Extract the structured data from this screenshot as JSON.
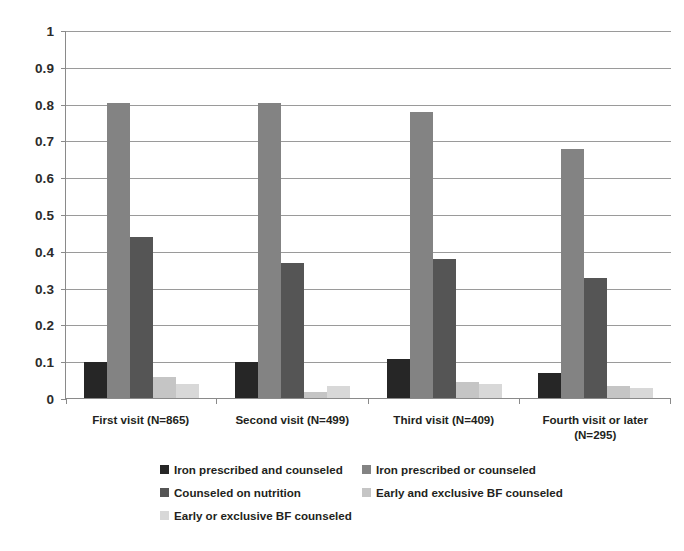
{
  "chart_data": {
    "type": "bar",
    "title": "",
    "subtitle": "",
    "xlabel": "",
    "ylabel": "",
    "ylim": [
      0,
      1
    ],
    "ytick_labels": [
      "1",
      "0.9",
      "0.8",
      "0.7",
      "0.6",
      "0.5",
      "0.4",
      "0.3",
      "0.2",
      "0.1",
      "0"
    ],
    "ytick_values": [
      1,
      0.9,
      0.8,
      0.7,
      0.6,
      0.5,
      0.4,
      0.3,
      0.2,
      0.1,
      0
    ],
    "grid": true,
    "grid_axis": "y",
    "legend_position": "bottom",
    "categories": [
      "First visit (N=865)",
      "Second visit (N=499)",
      "Third visit (N=409)",
      "Fourth visit or later (N=295)"
    ],
    "series": [
      {
        "name": "Iron prescribed and counseled",
        "color": "#262626",
        "values": [
          0.1,
          0.1,
          0.11,
          0.07
        ]
      },
      {
        "name": "Iron prescribed or counseled",
        "color": "#838383",
        "values": [
          0.805,
          0.805,
          0.78,
          0.68
        ]
      },
      {
        "name": "Counseled on nutrition",
        "color": "#555555",
        "values": [
          0.44,
          0.37,
          0.38,
          0.33
        ]
      },
      {
        "name": "Early and exclusive BF counseled",
        "color": "#c5c5c5",
        "values": [
          0.06,
          0.02,
          0.045,
          0.035
        ]
      },
      {
        "name": "Early or exclusive BF counseled",
        "color": "#d8d8d8",
        "values": [
          0.04,
          0.035,
          0.04,
          0.03
        ]
      }
    ]
  },
  "x_axis_labels": [
    {
      "line1": "First visit (N=865)",
      "line2": ""
    },
    {
      "line1": "Second visit (N=499)",
      "line2": ""
    },
    {
      "line1": "Third visit (N=409)",
      "line2": ""
    },
    {
      "line1": "Fourth visit or later",
      "line2": "(N=295)"
    }
  ],
  "legend_rows": [
    [
      {
        "label": "Iron prescribed and counseled",
        "color": "#262626"
      },
      {
        "label": "Iron prescribed or counseled",
        "color": "#838383"
      }
    ],
    [
      {
        "label": "Counseled on nutrition",
        "color": "#555555"
      },
      {
        "label": "Early and exclusive BF counseled",
        "color": "#c5c5c5"
      }
    ],
    [
      {
        "label": "Early or exclusive BF counseled",
        "color": "#d8d8d8"
      }
    ]
  ]
}
